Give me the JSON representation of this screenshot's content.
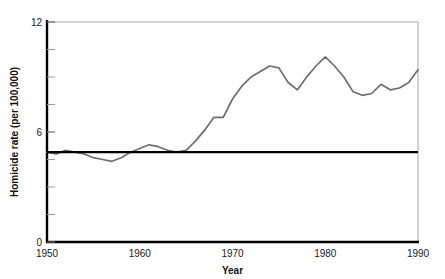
{
  "chart_data": {
    "type": "line",
    "title": "",
    "xlabel": "Year",
    "ylabel": "Homicide rate (per 100,000)",
    "xlim": [
      1950,
      1990
    ],
    "ylim": [
      0,
      12
    ],
    "xticks": [
      1950,
      1960,
      1970,
      1980,
      1990
    ],
    "yticks": [
      0,
      6,
      12
    ],
    "y_minor_ticks": [
      1.5,
      3,
      4.5,
      7.5,
      9,
      10.5
    ],
    "grid": false,
    "legend": "none",
    "line_color": "#6e6e6e",
    "reference_line_color": "#000000",
    "frame_color": "#9a9a9a",
    "axis_color": "#000000",
    "series": [
      {
        "name": "Homicide rate",
        "x": [
          1950,
          1951,
          1952,
          1953,
          1954,
          1955,
          1956,
          1957,
          1958,
          1959,
          1960,
          1961,
          1962,
          1963,
          1964,
          1965,
          1966,
          1967,
          1968,
          1969,
          1970,
          1971,
          1972,
          1973,
          1974,
          1975,
          1976,
          1977,
          1978,
          1979,
          1980,
          1981,
          1982,
          1983,
          1984,
          1985,
          1986,
          1987,
          1988,
          1989,
          1990
        ],
        "values": [
          4.9,
          4.8,
          5.0,
          4.9,
          4.8,
          4.6,
          4.5,
          4.4,
          4.6,
          4.9,
          5.1,
          5.3,
          5.2,
          5.0,
          4.9,
          5.0,
          5.5,
          6.1,
          6.8,
          6.8,
          7.8,
          8.5,
          9.0,
          9.3,
          9.6,
          9.5,
          8.7,
          8.3,
          9.0,
          9.6,
          10.1,
          9.6,
          9.0,
          8.2,
          8.0,
          8.1,
          8.6,
          8.3,
          8.4,
          8.7,
          9.4
        ]
      }
    ],
    "reference_line": {
      "name": "baseline-1950-rate",
      "y": 4.9,
      "x_from": 1950,
      "x_to": 1990
    }
  },
  "axes": {
    "y_label": "Homicide rate (per 100,000)",
    "x_label": "Year",
    "y_tick_top": "12",
    "y_tick_mid": "6",
    "y_tick_bottom": "0",
    "x_tick_0": "1950",
    "x_tick_1": "1960",
    "x_tick_2": "1970",
    "x_tick_3": "1980",
    "x_tick_4": "1990"
  }
}
